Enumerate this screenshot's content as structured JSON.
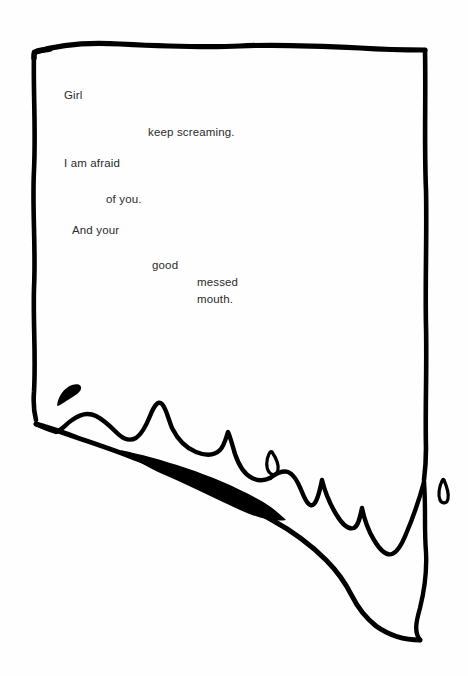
{
  "artwork": {
    "title": "Erasure poem on hand-drawn landscape border",
    "medium": "ink drawing with typed text",
    "background_color": "#fefefe",
    "ink_color": "#000000",
    "text_color": "#2b2b2b",
    "canvas": {
      "width": 468,
      "height": 676
    },
    "shapes": {
      "border_top_label": "hand-drawn top border line",
      "border_left_label": "hand-drawn left border line",
      "border_right_label": "hand-drawn right border line",
      "horizon_label": "jagged mountain ridge horizon",
      "filled_wedge_label": "solid black wedge",
      "crescent_label": "small crescent mark",
      "teardrop_left_label": "small teardrop mark",
      "teardrop_right_label": "small teardrop mark"
    }
  },
  "poem": {
    "lines": [
      {
        "text": "Girl",
        "x": 64,
        "y": 89
      },
      {
        "text": "keep screaming.",
        "x": 148,
        "y": 126
      },
      {
        "text": "I am afraid",
        "x": 64,
        "y": 157
      },
      {
        "text": "of you.",
        "x": 106,
        "y": 193
      },
      {
        "text": "And your",
        "x": 72,
        "y": 224
      },
      {
        "text": "good",
        "x": 152,
        "y": 259
      },
      {
        "text": "messed",
        "x": 197,
        "y": 276
      },
      {
        "text": "mouth.",
        "x": 197,
        "y": 293
      }
    ]
  }
}
